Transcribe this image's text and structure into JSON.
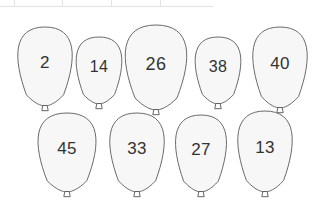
{
  "page": {
    "background_color": "#ffffff",
    "width": 322,
    "height": 202
  },
  "table_fragment": {
    "name": "clipped-table-top-edge",
    "border_color": "#e2e2e2",
    "column_widths": [
      15,
      48,
      49,
      49,
      49
    ],
    "visible_height": 7
  },
  "style": {
    "balloon_fill": "#f7f7f7",
    "balloon_stroke": "#6b6b6b",
    "knot_fill": "#fdfdfd",
    "knot_stroke": "#555555",
    "number_color": "#333333"
  },
  "balloons": [
    {
      "label": "2",
      "row": 1,
      "index": 0,
      "x": 14,
      "y": 26,
      "w": 62,
      "h": 80,
      "font_size": 17
    },
    {
      "label": "14",
      "row": 1,
      "index": 1,
      "x": 73,
      "y": 36,
      "w": 52,
      "h": 68,
      "font_size": 16
    },
    {
      "label": "26",
      "row": 1,
      "index": 2,
      "x": 121,
      "y": 24,
      "w": 70,
      "h": 86,
      "font_size": 18
    },
    {
      "label": "38",
      "row": 1,
      "index": 3,
      "x": 192,
      "y": 36,
      "w": 52,
      "h": 68,
      "font_size": 16
    },
    {
      "label": "40",
      "row": 1,
      "index": 4,
      "x": 249,
      "y": 26,
      "w": 62,
      "h": 82,
      "font_size": 17
    },
    {
      "label": "45",
      "row": 2,
      "index": 0,
      "x": 34,
      "y": 112,
      "w": 66,
      "h": 80,
      "font_size": 17
    },
    {
      "label": "33",
      "row": 2,
      "index": 1,
      "x": 106,
      "y": 112,
      "w": 62,
      "h": 80,
      "font_size": 17
    },
    {
      "label": "27",
      "row": 2,
      "index": 2,
      "x": 172,
      "y": 114,
      "w": 58,
      "h": 78,
      "font_size": 17
    },
    {
      "label": "13",
      "row": 2,
      "index": 3,
      "x": 234,
      "y": 110,
      "w": 62,
      "h": 82,
      "font_size": 17
    }
  ]
}
